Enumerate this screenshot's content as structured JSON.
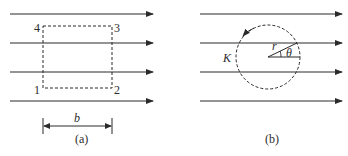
{
  "figure": {
    "panels": [
      {
        "id": "a",
        "caption": "(a)",
        "field_lines": 4,
        "loop": {
          "shape": "rectangle",
          "style": "dashed",
          "corner_labels": {
            "bottom_left": "1",
            "bottom_right": "2",
            "top_right": "3",
            "top_left": "4"
          }
        },
        "dimension": {
          "label": "b"
        }
      },
      {
        "id": "b",
        "caption": "(b)",
        "field_lines": 4,
        "loop": {
          "shape": "circle",
          "style": "dashed",
          "label": "K",
          "direction": "counterclockwise"
        },
        "radius_label": "r",
        "angle_label": "θ"
      }
    ],
    "colors": {
      "line": "#2b2b2b",
      "background": "#ffffff"
    }
  }
}
